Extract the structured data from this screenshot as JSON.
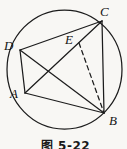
{
  "figure": {
    "caption": "图 5-22",
    "background_color": "#f8f7f4",
    "line_color": "#1c1c1c",
    "label_color": "#141414",
    "circle": {
      "cx": 64.5,
      "cy": 69.5,
      "rx": 57.5,
      "ry": 59.5
    },
    "points": {
      "A": {
        "label": "A",
        "x": 25,
        "y": 93,
        "label_x": 10,
        "label_y": 98
      },
      "B": {
        "label": "B",
        "x": 104,
        "y": 113,
        "label_x": 109,
        "label_y": 125
      },
      "C": {
        "label": "C",
        "x": 102,
        "y": 21,
        "label_x": 100,
        "label_y": 16
      },
      "D": {
        "label": "D",
        "x": 20,
        "y": 50,
        "label_x": 4,
        "label_y": 50
      },
      "E": {
        "label": "E",
        "x": 79,
        "y": 43,
        "label_x": 65,
        "label_y": 44
      }
    },
    "edges": [
      {
        "from": "D",
        "to": "C",
        "style": "solid"
      },
      {
        "from": "D",
        "to": "B",
        "style": "solid"
      },
      {
        "from": "D",
        "to": "A",
        "style": "solid"
      },
      {
        "from": "A",
        "to": "C",
        "style": "solid"
      },
      {
        "from": "A",
        "to": "B",
        "style": "solid"
      },
      {
        "from": "C",
        "to": "B",
        "style": "solid"
      },
      {
        "from": "E",
        "to": "B",
        "style": "dashed"
      }
    ],
    "dash_pattern": "4.5 3.5",
    "stroke_width": 1.25
  }
}
